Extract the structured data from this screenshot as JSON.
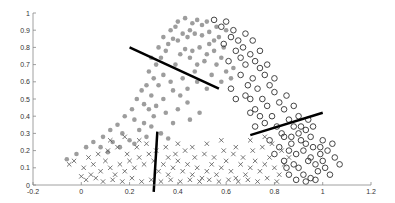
{
  "chart_data": {
    "type": "scatter",
    "title": "",
    "xlabel": "",
    "ylabel": "",
    "xlim": [
      -0.2,
      1.2
    ],
    "ylim": [
      0,
      1
    ],
    "xticks": [
      "-0.2",
      "0",
      "0.2",
      "0.4",
      "0.6",
      "0.8",
      "1",
      "1.2"
    ],
    "yticks": [
      "0",
      "0.1",
      "0.2",
      "0.3",
      "0.4",
      "0.5",
      "0.6",
      "0.7",
      "0.8",
      "0.9",
      "1"
    ],
    "grid": false,
    "legend": null,
    "series": [
      {
        "name": "class-filled-dots",
        "marker": "filled-circle",
        "color": "#8c8c8c",
        "region": "upper-left band, peak near x=0.45-0.55, y=0.9",
        "points": [
          [
            0.4,
            0.95
          ],
          [
            0.43,
            0.97
          ],
          [
            0.46,
            0.94
          ],
          [
            0.48,
            0.96
          ],
          [
            0.5,
            0.93
          ],
          [
            0.52,
            0.95
          ],
          [
            0.45,
            0.9
          ],
          [
            0.42,
            0.88
          ],
          [
            0.38,
            0.85
          ],
          [
            0.36,
            0.82
          ],
          [
            0.4,
            0.84
          ],
          [
            0.44,
            0.86
          ],
          [
            0.47,
            0.88
          ],
          [
            0.5,
            0.87
          ],
          [
            0.53,
            0.89
          ],
          [
            0.55,
            0.84
          ],
          [
            0.57,
            0.86
          ],
          [
            0.49,
            0.8
          ],
          [
            0.46,
            0.78
          ],
          [
            0.43,
            0.79
          ],
          [
            0.52,
            0.76
          ],
          [
            0.55,
            0.78
          ],
          [
            0.58,
            0.74
          ],
          [
            0.51,
            0.72
          ],
          [
            0.48,
            0.7
          ],
          [
            0.56,
            0.7
          ],
          [
            0.6,
            0.66
          ],
          [
            0.62,
            0.62
          ],
          [
            0.35,
            0.78
          ],
          [
            0.33,
            0.74
          ],
          [
            0.31,
            0.7
          ],
          [
            0.28,
            0.66
          ],
          [
            0.3,
            0.62
          ],
          [
            0.34,
            0.64
          ],
          [
            0.37,
            0.6
          ],
          [
            0.27,
            0.58
          ],
          [
            0.25,
            0.55
          ],
          [
            0.29,
            0.52
          ],
          [
            0.23,
            0.5
          ],
          [
            0.26,
            0.47
          ],
          [
            0.31,
            0.46
          ],
          [
            0.34,
            0.5
          ],
          [
            0.38,
            0.55
          ],
          [
            0.41,
            0.52
          ],
          [
            0.44,
            0.48
          ],
          [
            0.21,
            0.44
          ],
          [
            0.18,
            0.4
          ],
          [
            0.22,
            0.38
          ],
          [
            0.26,
            0.36
          ],
          [
            0.3,
            0.4
          ],
          [
            0.35,
            0.42
          ],
          [
            0.4,
            0.44
          ],
          [
            0.15,
            0.35
          ],
          [
            0.12,
            0.32
          ],
          [
            0.17,
            0.3
          ],
          [
            0.24,
            0.32
          ],
          [
            0.29,
            0.34
          ],
          [
            0.33,
            0.3
          ],
          [
            0.38,
            0.36
          ],
          [
            0.09,
            0.28
          ],
          [
            0.05,
            0.25
          ],
          [
            0.02,
            0.22
          ],
          [
            0.08,
            0.22
          ],
          [
            0.13,
            0.25
          ],
          [
            0.2,
            0.26
          ],
          [
            0.27,
            0.28
          ],
          [
            0.36,
            0.27
          ],
          [
            0.45,
            0.38
          ],
          [
            0.49,
            0.42
          ],
          [
            0.58,
            0.6
          ],
          [
            0.63,
            0.68
          ],
          [
            0.54,
            0.64
          ],
          [
            0.47,
            0.66
          ],
          [
            0.42,
            0.62
          ],
          [
            0.39,
            0.7
          ],
          [
            0.45,
            0.74
          ],
          [
            0.41,
            0.76
          ],
          [
            0.53,
            0.82
          ],
          [
            0.59,
            0.8
          ],
          [
            0.6,
            0.9
          ],
          [
            0.56,
            0.92
          ],
          [
            0.37,
            0.9
          ],
          [
            0.39,
            0.92
          ],
          [
            0.34,
            0.86
          ],
          [
            -0.02,
            0.18
          ],
          [
            -0.06,
            0.15
          ],
          [
            0.11,
            0.19
          ],
          [
            0.32,
            0.58
          ],
          [
            0.28,
            0.44
          ],
          [
            0.16,
            0.22
          ],
          [
            0.22,
            0.24
          ],
          [
            0.44,
            0.56
          ],
          [
            0.48,
            0.6
          ],
          [
            0.52,
            0.56
          ],
          [
            0.29,
            0.74
          ],
          [
            0.32,
            0.8
          ]
        ]
      },
      {
        "name": "class-open-circles",
        "marker": "open-circle",
        "color": "#444444",
        "region": "right band, from x=0.5,y=0.95 down to x=0.9-1.0,y=0.05-0.3",
        "points": [
          [
            0.55,
            0.96
          ],
          [
            0.58,
            0.92
          ],
          [
            0.6,
            0.95
          ],
          [
            0.63,
            0.9
          ],
          [
            0.62,
            0.86
          ],
          [
            0.65,
            0.84
          ],
          [
            0.67,
            0.8
          ],
          [
            0.59,
            0.82
          ],
          [
            0.7,
            0.76
          ],
          [
            0.72,
            0.72
          ],
          [
            0.68,
            0.7
          ],
          [
            0.66,
            0.74
          ],
          [
            0.74,
            0.68
          ],
          [
            0.76,
            0.64
          ],
          [
            0.71,
            0.62
          ],
          [
            0.69,
            0.58
          ],
          [
            0.73,
            0.56
          ],
          [
            0.78,
            0.58
          ],
          [
            0.8,
            0.54
          ],
          [
            0.75,
            0.5
          ],
          [
            0.77,
            0.46
          ],
          [
            0.82,
            0.48
          ],
          [
            0.84,
            0.44
          ],
          [
            0.79,
            0.4
          ],
          [
            0.72,
            0.44
          ],
          [
            0.7,
            0.5
          ],
          [
            0.68,
            0.52
          ],
          [
            0.74,
            0.4
          ],
          [
            0.76,
            0.36
          ],
          [
            0.81,
            0.34
          ],
          [
            0.86,
            0.38
          ],
          [
            0.88,
            0.34
          ],
          [
            0.9,
            0.3
          ],
          [
            0.93,
            0.32
          ],
          [
            0.95,
            0.28
          ],
          [
            0.91,
            0.26
          ],
          [
            0.87,
            0.24
          ],
          [
            0.84,
            0.28
          ],
          [
            0.82,
            0.22
          ],
          [
            0.86,
            0.2
          ],
          [
            0.89,
            0.18
          ],
          [
            0.92,
            0.2
          ],
          [
            0.96,
            0.22
          ],
          [
            0.99,
            0.18
          ],
          [
            1.02,
            0.2
          ],
          [
            1.05,
            0.16
          ],
          [
            1.0,
            0.14
          ],
          [
            0.97,
            0.12
          ],
          [
            0.94,
            0.14
          ],
          [
            0.9,
            0.1
          ],
          [
            0.88,
            0.12
          ],
          [
            0.92,
            0.06
          ],
          [
            0.95,
            0.04
          ],
          [
            0.98,
            0.08
          ],
          [
            1.01,
            0.1
          ],
          [
            1.03,
            0.06
          ],
          [
            0.86,
            0.06
          ],
          [
            0.89,
            0.03
          ],
          [
            0.93,
            0.02
          ],
          [
            0.97,
            0.03
          ],
          [
            0.84,
            0.14
          ],
          [
            0.8,
            0.18
          ],
          [
            0.78,
            0.26
          ],
          [
            0.83,
            0.3
          ],
          [
            0.9,
            0.4
          ],
          [
            0.94,
            0.38
          ],
          [
            0.88,
            0.46
          ],
          [
            0.85,
            0.52
          ],
          [
            0.8,
            0.62
          ],
          [
            0.77,
            0.7
          ],
          [
            0.74,
            0.78
          ],
          [
            0.71,
            0.84
          ],
          [
            0.68,
            0.88
          ],
          [
            0.64,
            0.78
          ],
          [
            0.61,
            0.72
          ],
          [
            0.66,
            0.64
          ],
          [
            0.62,
            0.56
          ],
          [
            0.64,
            0.5
          ],
          [
            0.7,
            0.42
          ],
          [
            0.72,
            0.34
          ],
          [
            0.96,
            0.34
          ],
          [
            1.0,
            0.26
          ],
          [
            1.04,
            0.24
          ],
          [
            1.07,
            0.12
          ],
          [
            0.91,
            0.34
          ],
          [
            0.87,
            0.28
          ],
          [
            0.93,
            0.24
          ],
          [
            0.85,
            0.1
          ],
          [
            0.99,
            0.22
          ],
          [
            0.95,
            0.16
          ]
        ]
      },
      {
        "name": "class-crosses",
        "marker": "x",
        "color": "#555555",
        "region": "bottom band, y from 0 to 0.3, x from -0.05 to 0.85",
        "points": [
          [
            0.0,
            0.05
          ],
          [
            0.02,
            0.03
          ],
          [
            0.04,
            0.06
          ],
          [
            0.06,
            0.04
          ],
          [
            0.08,
            0.08
          ],
          [
            0.01,
            0.1
          ],
          [
            0.05,
            0.12
          ],
          [
            0.1,
            0.14
          ],
          [
            0.12,
            0.1
          ],
          [
            0.14,
            0.06
          ],
          [
            0.16,
            0.12
          ],
          [
            0.18,
            0.08
          ],
          [
            0.2,
            0.14
          ],
          [
            0.22,
            0.1
          ],
          [
            0.24,
            0.16
          ],
          [
            0.26,
            0.12
          ],
          [
            0.28,
            0.18
          ],
          [
            0.3,
            0.14
          ],
          [
            0.32,
            0.08
          ],
          [
            0.34,
            0.12
          ],
          [
            0.36,
            0.06
          ],
          [
            0.38,
            0.1
          ],
          [
            0.4,
            0.14
          ],
          [
            0.42,
            0.08
          ],
          [
            0.44,
            0.12
          ],
          [
            0.46,
            0.06
          ],
          [
            0.48,
            0.1
          ],
          [
            0.5,
            0.04
          ],
          [
            0.52,
            0.08
          ],
          [
            0.54,
            0.12
          ],
          [
            0.56,
            0.06
          ],
          [
            0.58,
            0.1
          ],
          [
            0.6,
            0.14
          ],
          [
            0.62,
            0.08
          ],
          [
            0.64,
            0.04
          ],
          [
            0.66,
            0.12
          ],
          [
            0.68,
            0.06
          ],
          [
            0.7,
            0.1
          ],
          [
            0.72,
            0.14
          ],
          [
            0.74,
            0.08
          ],
          [
            0.76,
            0.12
          ],
          [
            0.78,
            0.16
          ],
          [
            0.8,
            0.1
          ],
          [
            0.82,
            0.06
          ],
          [
            0.84,
            0.12
          ],
          [
            0.03,
            0.16
          ],
          [
            0.07,
            0.18
          ],
          [
            0.11,
            0.2
          ],
          [
            0.15,
            0.22
          ],
          [
            0.19,
            0.18
          ],
          [
            0.23,
            0.22
          ],
          [
            0.27,
            0.24
          ],
          [
            0.31,
            0.2
          ],
          [
            0.35,
            0.22
          ],
          [
            0.39,
            0.18
          ],
          [
            0.43,
            0.2
          ],
          [
            0.47,
            0.16
          ],
          [
            0.51,
            0.18
          ],
          [
            0.55,
            0.16
          ],
          [
            0.59,
            0.2
          ],
          [
            0.63,
            0.18
          ],
          [
            0.67,
            0.16
          ],
          [
            0.71,
            0.2
          ],
          [
            0.75,
            0.22
          ],
          [
            0.79,
            0.24
          ],
          [
            0.83,
            0.2
          ],
          [
            -0.03,
            0.14
          ],
          [
            -0.05,
            0.12
          ],
          [
            0.09,
            0.02
          ],
          [
            0.13,
            0.03
          ],
          [
            0.17,
            0.02
          ],
          [
            0.21,
            0.04
          ],
          [
            0.25,
            0.02
          ],
          [
            0.29,
            0.03
          ],
          [
            0.33,
            0.02
          ],
          [
            0.37,
            0.03
          ],
          [
            0.41,
            0.02
          ],
          [
            0.45,
            0.03
          ],
          [
            0.49,
            0.02
          ],
          [
            0.53,
            0.03
          ],
          [
            0.57,
            0.02
          ],
          [
            0.61,
            0.03
          ],
          [
            0.65,
            0.02
          ],
          [
            0.69,
            0.03
          ],
          [
            0.73,
            0.02
          ],
          [
            0.77,
            0.04
          ],
          [
            0.81,
            0.02
          ],
          [
            0.12,
            0.26
          ],
          [
            0.18,
            0.28
          ],
          [
            0.24,
            0.26
          ],
          [
            0.36,
            0.16
          ],
          [
            0.4,
            0.24
          ],
          [
            0.46,
            0.22
          ],
          [
            0.52,
            0.24
          ],
          [
            0.58,
            0.26
          ],
          [
            0.64,
            0.22
          ],
          [
            0.7,
            0.26
          ],
          [
            0.76,
            0.28
          ],
          [
            0.86,
            0.16
          ]
        ]
      }
    ],
    "lines": [
      {
        "name": "boundary-upper-left",
        "from": [
          0.2,
          0.8
        ],
        "to": [
          0.57,
          0.56
        ],
        "color": "#000000",
        "width": 2.5
      },
      {
        "name": "boundary-right",
        "from": [
          0.7,
          0.29
        ],
        "to": [
          1.0,
          0.42
        ],
        "color": "#000000",
        "width": 2.5
      },
      {
        "name": "boundary-vertical",
        "from": [
          0.315,
          0.31
        ],
        "to": [
          0.3,
          -0.04
        ],
        "color": "#000000",
        "width": 2.5
      }
    ]
  },
  "plot_box": {
    "left": 33,
    "right": 371,
    "top": 13,
    "bottom": 185
  }
}
